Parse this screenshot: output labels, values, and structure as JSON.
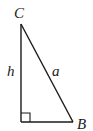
{
  "diagram": {
    "type": "right-triangle",
    "vertices": {
      "C": {
        "label": "C"
      },
      "B": {
        "label": "B"
      }
    },
    "sides": {
      "vertical": {
        "label": "h"
      },
      "hypotenuse": {
        "label": "a"
      }
    },
    "right_angle_marker": true,
    "colors": {
      "stroke": "#1a1a1a",
      "background": "#ffffff"
    }
  }
}
